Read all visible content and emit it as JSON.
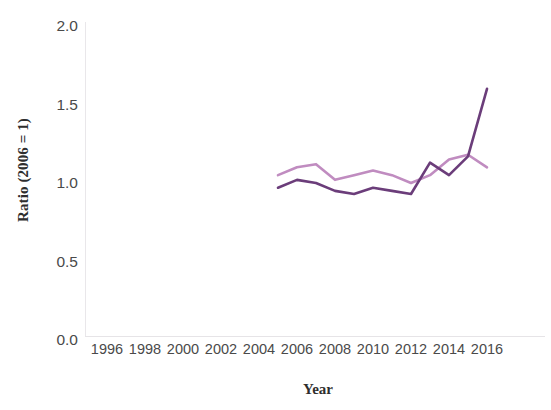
{
  "chart_data": {
    "type": "line",
    "title": "",
    "xlabel": "Year",
    "ylabel": "Ratio (2006 = 1)",
    "xlim": [
      1995,
      2017
    ],
    "ylim": [
      0.0,
      2.0
    ],
    "grid": false,
    "legend": "none",
    "xticks": [
      "1996",
      "1998",
      "2000",
      "2002",
      "2004",
      "2006",
      "2008",
      "2010",
      "2012",
      "2014",
      "2016"
    ],
    "xtick_values": [
      1996,
      1998,
      2000,
      2002,
      2004,
      2006,
      2008,
      2010,
      2012,
      2014,
      2016
    ],
    "yticks": [
      "0.0",
      "0.5",
      "1.0",
      "1.5",
      "2.0"
    ],
    "ytick_values": [
      0.0,
      0.5,
      1.0,
      1.5,
      2.0
    ],
    "x": [
      2005,
      2006,
      2007,
      2008,
      2009,
      2010,
      2011,
      2012,
      2013,
      2014,
      2015,
      2016
    ],
    "series": [
      {
        "name": "light-orchid-series",
        "color": "#c08cc0",
        "values": [
          1.05,
          1.1,
          1.12,
          1.02,
          1.05,
          1.08,
          1.05,
          1.0,
          1.05,
          1.15,
          1.18,
          1.1
        ]
      },
      {
        "name": "dark-purple-series",
        "color": "#6b3d7a",
        "values": [
          0.97,
          1.02,
          1.0,
          0.95,
          0.93,
          0.97,
          0.95,
          0.93,
          1.13,
          1.05,
          1.17,
          1.6
        ]
      }
    ]
  },
  "colors": {
    "background": "#ffffff",
    "axis_text": "#4a4a4a",
    "axis_title": "#2e2e2e",
    "axis_rule": "#e8e6e9"
  }
}
